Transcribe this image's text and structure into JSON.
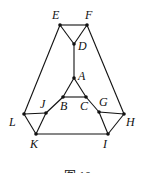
{
  "diagram": {
    "type": "graph",
    "nodes": [
      {
        "id": "E",
        "x": 60,
        "y": 25,
        "lx": 52,
        "ly": 19
      },
      {
        "id": "F",
        "x": 87,
        "y": 25,
        "lx": 85,
        "ly": 19
      },
      {
        "id": "D",
        "x": 74,
        "y": 44,
        "lx": 78,
        "ly": 50
      },
      {
        "id": "A",
        "x": 74,
        "y": 78,
        "lx": 78,
        "ly": 80
      },
      {
        "id": "B",
        "x": 63,
        "y": 97,
        "lx": 60,
        "ly": 110
      },
      {
        "id": "C",
        "x": 86,
        "y": 97,
        "lx": 80,
        "ly": 110
      },
      {
        "id": "J",
        "x": 46,
        "y": 113,
        "lx": 40,
        "ly": 108
      },
      {
        "id": "G",
        "x": 99,
        "y": 112,
        "lx": 99,
        "ly": 106
      },
      {
        "id": "L",
        "x": 24,
        "y": 114,
        "lx": 9,
        "ly": 126
      },
      {
        "id": "H",
        "x": 124,
        "y": 114,
        "lx": 126,
        "ly": 126
      },
      {
        "id": "K",
        "x": 36,
        "y": 134,
        "lx": 30,
        "ly": 148
      },
      {
        "id": "I",
        "x": 108,
        "y": 134,
        "lx": 103,
        "ly": 148
      }
    ],
    "edges": [
      [
        "E",
        "F"
      ],
      [
        "E",
        "D"
      ],
      [
        "F",
        "D"
      ],
      [
        "D",
        "A"
      ],
      [
        "A",
        "B"
      ],
      [
        "A",
        "C"
      ],
      [
        "B",
        "C"
      ],
      [
        "E",
        "L"
      ],
      [
        "F",
        "H"
      ],
      [
        "L",
        "J"
      ],
      [
        "J",
        "B"
      ],
      [
        "L",
        "K"
      ],
      [
        "J",
        "K"
      ],
      [
        "C",
        "G"
      ],
      [
        "G",
        "H"
      ],
      [
        "H",
        "I"
      ],
      [
        "G",
        "I"
      ],
      [
        "K",
        "I"
      ]
    ],
    "caption": "图 10"
  }
}
